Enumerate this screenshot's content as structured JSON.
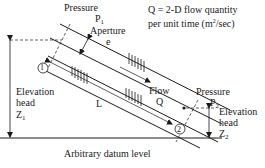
{
  "legend": {
    "line1": "Q = 2-D flow quantity",
    "line2_prefix": "per unit time (m",
    "line2_sup": "2",
    "line2_suffix": "/sec)"
  },
  "labels": {
    "pressure1": "Pressure",
    "p1": "P",
    "p1_sub": "1",
    "aperture": "Aperture",
    "aperture_symbol": "e",
    "point1": "1",
    "point2": "2",
    "elev1_line1": "Elevation",
    "elev1_line2": "head",
    "z1": "Z",
    "z1_sub": "1",
    "length": "L",
    "flow": "Flow",
    "flow_symbol": "Q",
    "pressure2": "Pressure",
    "p2": "P",
    "p2_sub": "2",
    "elev2_line1": "Elevation",
    "elev2_line2": "head",
    "z2": "Z",
    "z2_sub": "2",
    "datum": "Arbitrary datum level"
  },
  "colors": {
    "ink": "#1a1a1a",
    "background": "#ffffff"
  }
}
